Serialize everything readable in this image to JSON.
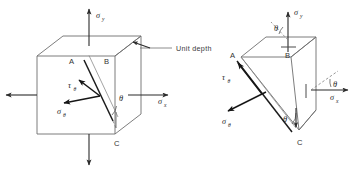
{
  "figure": {
    "background_color": "#ffffff",
    "line_color": "#6e6e6e",
    "symbol_color": "#1f1f1f",
    "annotation": {
      "unit_depth_label": "Unit  depth"
    },
    "panels": [
      {
        "id": "left",
        "name": "stressed-cube",
        "description": "Cube element with inclined cut plane A-C",
        "vertices": [
          {
            "label": "A",
            "role": "inclined-plane-top"
          },
          {
            "label": "B",
            "role": "front-top-right"
          },
          {
            "label": "C",
            "role": "front-bottom-right"
          }
        ],
        "stresses": [
          {
            "symbol": "σ",
            "subscript": "y",
            "name": "sigma-y",
            "direction": "up",
            "position": "top"
          },
          {
            "symbol": "σ",
            "subscript": "y",
            "name": "sigma-y-reaction",
            "direction": "down",
            "position": "bottom"
          },
          {
            "symbol": "σ",
            "subscript": "x",
            "name": "sigma-x",
            "direction": "right",
            "position": "right"
          },
          {
            "symbol": "σ",
            "subscript": "x",
            "name": "sigma-x-reaction",
            "direction": "left",
            "position": "left"
          },
          {
            "symbol": "τ",
            "subscript": "θ",
            "name": "tau-theta",
            "direction": "along-plane"
          },
          {
            "symbol": "σ",
            "subscript": "θ",
            "name": "sigma-theta",
            "direction": "normal-to-plane"
          }
        ],
        "angles": [
          {
            "symbol": "θ",
            "name": "theta-plane-angle",
            "vertex": "C"
          }
        ]
      },
      {
        "id": "right",
        "name": "wedge-free-body",
        "description": "Triangular wedge free body cut along A-C",
        "vertices": [
          {
            "label": "A",
            "role": "wedge-top-left"
          },
          {
            "label": "B",
            "role": "wedge-top-right"
          },
          {
            "label": "C",
            "role": "wedge-bottom"
          }
        ],
        "stresses": [
          {
            "symbol": "σ",
            "subscript": "y",
            "name": "sigma-y",
            "direction": "up",
            "position": "top"
          },
          {
            "symbol": "σ",
            "subscript": "x",
            "name": "sigma-x",
            "direction": "right",
            "position": "right"
          },
          {
            "symbol": "τ",
            "subscript": "θ",
            "name": "tau-theta",
            "direction": "along-plane"
          },
          {
            "symbol": "σ",
            "subscript": "θ",
            "name": "sigma-theta",
            "direction": "normal-to-plane"
          }
        ],
        "angles": [
          {
            "symbol": "θ",
            "name": "theta-top",
            "vertex": "top-face"
          },
          {
            "symbol": "θ",
            "name": "theta-right",
            "vertex": "right-face"
          },
          {
            "symbol": "θ",
            "name": "theta-bottom",
            "vertex": "C"
          }
        ]
      }
    ],
    "symbols": {
      "sigma": "σ",
      "tau": "τ",
      "theta": "θ",
      "sub_x": "x",
      "sub_y": "y",
      "sub_theta": "θ",
      "point_a": "A",
      "point_b": "B",
      "point_c": "C"
    }
  }
}
